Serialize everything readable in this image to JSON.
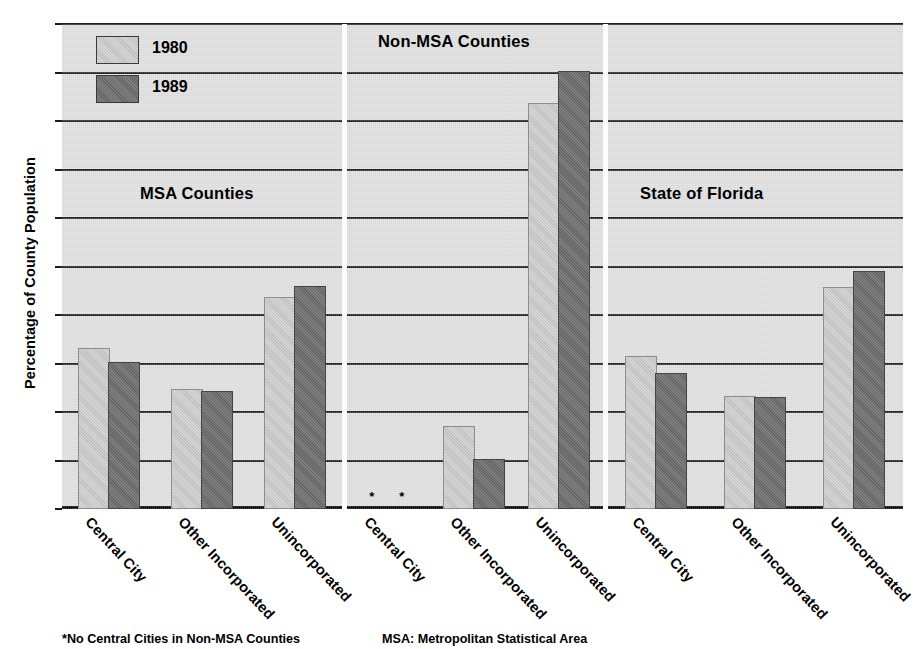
{
  "chart_data": {
    "type": "bar",
    "title": "",
    "xlabel": "",
    "ylabel": "Percentage of County Population",
    "ylim": [
      0,
      100
    ],
    "ytick_values": [
      0,
      10,
      20,
      30,
      40,
      50,
      60,
      70,
      80,
      90,
      100
    ],
    "ytick_labels": [
      "0",
      "10",
      "20",
      "30",
      "40",
      "50",
      "60",
      "70",
      "80",
      "90",
      "100"
    ],
    "grid": true,
    "legend_position": "upper-left-inside",
    "categories": [
      "Central City",
      "Other Incorporated",
      "Unincorporated"
    ],
    "series": [
      {
        "name": "1980",
        "color": "#c6c6c6"
      },
      {
        "name": "1989",
        "color": "#6e6e6e"
      }
    ],
    "panels": [
      {
        "title": "MSA Counties",
        "categories": [
          "Central City",
          "Other Incorporated",
          "Unincorporated"
        ],
        "series": [
          {
            "name": "1980",
            "values": [
              32.7,
              24.3,
              43.4
            ]
          },
          {
            "name": "1989",
            "values": [
              30.0,
              24.0,
              45.6
            ]
          }
        ]
      },
      {
        "title": "Non-MSA Counties",
        "categories": [
          "Central City",
          "Other Incorporated",
          "Unincorporated"
        ],
        "series": [
          {
            "name": "1980",
            "values": [
              null,
              16.8,
              83.3
            ]
          },
          {
            "name": "1989",
            "values": [
              null,
              9.8,
              90.0
            ]
          }
        ],
        "missing_marker": "*"
      },
      {
        "title": "State of Florida",
        "categories": [
          "Central City",
          "Other Incorporated",
          "Unincorporated"
        ],
        "series": [
          {
            "name": "1980",
            "values": [
              31.1,
              22.8,
              45.4
            ]
          },
          {
            "name": "1989",
            "values": [
              27.7,
              22.7,
              48.7
            ]
          }
        ]
      }
    ],
    "annotations": [
      "*No Central Cities in Non-MSA Counties",
      "MSA: Metropolitan Statistical Area"
    ]
  },
  "legend": {
    "items": [
      {
        "label": "1980"
      },
      {
        "label": "1989"
      }
    ]
  },
  "panel_titles": {
    "msa": "MSA Counties",
    "non_msa": "Non-MSA Counties",
    "florida": "State of Florida"
  },
  "axis": {
    "y_title": "Percentage of County Population"
  },
  "footnotes": {
    "no_central_cities": "*No Central Cities in Non-MSA Counties",
    "msa_definition": "MSA: Metropolitan Statistical Area"
  },
  "colors": {
    "series_1980": "#c6c6c6",
    "series_1989": "#6e6e6e",
    "plot_background": "#dedede",
    "gridline": "#1c1c1c",
    "separator": "#fdfdfd"
  }
}
